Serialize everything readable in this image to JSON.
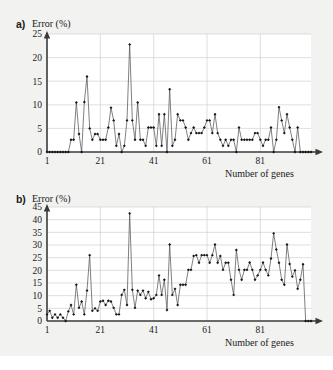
{
  "figure": {
    "background_color": "#f2f2f0",
    "plot_background_color": "#ffffff",
    "gridline_color": "#c9c9c9",
    "axis_color": "#3a3a3a",
    "series_color": "#55555a",
    "marker_color": "#16161a"
  },
  "panel_a": {
    "label": "a)",
    "ylabel": "Error (%)",
    "xlabel": "Number of genes"
  },
  "panel_b": {
    "label": "b)",
    "ylabel": "Error (%)",
    "xlabel": "Number of genes"
  },
  "chart_data": [
    {
      "id": "panel-a",
      "type": "line",
      "title": "a) Error (%)",
      "xlabel": "Number of genes",
      "ylabel": "Error (%)",
      "xlim": [
        1,
        100
      ],
      "ylim": [
        0,
        25
      ],
      "xticks": [
        1,
        21,
        41,
        61,
        81
      ],
      "yticks": [
        0,
        5,
        10,
        15,
        20,
        25
      ],
      "grid": "horizontal-and-vertical",
      "legend": "none",
      "marker": "diamond",
      "x": [
        1,
        2,
        3,
        4,
        5,
        6,
        7,
        8,
        9,
        10,
        11,
        12,
        13,
        14,
        15,
        16,
        17,
        18,
        19,
        20,
        21,
        22,
        23,
        24,
        25,
        26,
        27,
        28,
        29,
        30,
        31,
        32,
        33,
        34,
        35,
        36,
        37,
        38,
        39,
        40,
        41,
        42,
        43,
        44,
        45,
        46,
        47,
        48,
        49,
        50,
        51,
        52,
        53,
        54,
        55,
        56,
        57,
        58,
        59,
        60,
        61,
        62,
        63,
        64,
        65,
        66,
        67,
        68,
        69,
        70,
        71,
        72,
        73,
        74,
        75,
        76,
        77,
        78,
        79,
        80,
        81,
        82,
        83,
        84,
        85,
        86,
        87,
        88,
        89,
        90,
        91,
        92,
        93,
        94,
        95,
        96,
        97,
        98,
        99,
        100
      ],
      "values": [
        0,
        0,
        0,
        0,
        0,
        0,
        0,
        0,
        0,
        2.6,
        2.6,
        10.5,
        3.8,
        0,
        10.6,
        16,
        5,
        2.6,
        3.8,
        3.8,
        2.6,
        2.6,
        2.6,
        5.2,
        9.4,
        6.7,
        1.3,
        3.8,
        0,
        1.3,
        6.7,
        22.8,
        6.7,
        2.6,
        10.5,
        2.6,
        2.6,
        1.3,
        5.2,
        5.2,
        5.2,
        1.3,
        8,
        1.3,
        8,
        0,
        13.3,
        1.3,
        2.6,
        8,
        6.7,
        6.7,
        5.2,
        2.6,
        4,
        5.2,
        4,
        4,
        4,
        5.2,
        6.7,
        6.7,
        4,
        8,
        4,
        2.6,
        1.3,
        2.6,
        1.3,
        2.6,
        2.6,
        0,
        5.2,
        2.6,
        2.6,
        2.6,
        2.6,
        2.6,
        4,
        4,
        2.6,
        1.3,
        2.6,
        2.6,
        5.2,
        0,
        2.6,
        9.5,
        6.7,
        4,
        8,
        5.2,
        2.6,
        0,
        5.2,
        0,
        0,
        0,
        0,
        0
      ]
    },
    {
      "id": "panel-b",
      "type": "line",
      "title": "b) Error (%)",
      "xlabel": "Number of genes",
      "ylabel": "Error (%)",
      "xlim": [
        1,
        100
      ],
      "ylim": [
        0,
        45
      ],
      "xticks": [
        1,
        21,
        41,
        61,
        81
      ],
      "yticks": [
        0,
        5,
        10,
        15,
        20,
        25,
        30,
        35,
        40,
        45
      ],
      "grid": "horizontal-and-vertical",
      "legend": "none",
      "marker": "diamond",
      "x": [
        1,
        2,
        3,
        4,
        5,
        6,
        7,
        8,
        9,
        10,
        11,
        12,
        13,
        14,
        15,
        16,
        17,
        18,
        19,
        20,
        21,
        22,
        23,
        24,
        25,
        26,
        27,
        28,
        29,
        30,
        31,
        32,
        33,
        34,
        35,
        36,
        37,
        38,
        39,
        40,
        41,
        42,
        43,
        44,
        45,
        46,
        47,
        48,
        49,
        50,
        51,
        52,
        53,
        54,
        55,
        56,
        57,
        58,
        59,
        60,
        61,
        62,
        63,
        64,
        65,
        66,
        67,
        68,
        69,
        70,
        71,
        72,
        73,
        74,
        75,
        76,
        77,
        78,
        79,
        80,
        81,
        82,
        83,
        84,
        85,
        86,
        87,
        88,
        89,
        90,
        91,
        92,
        93,
        94,
        95,
        96,
        97,
        98,
        99,
        100
      ],
      "values": [
        2.6,
        4,
        1.3,
        2.6,
        1.3,
        2.6,
        1.3,
        0,
        3.8,
        6.3,
        2.6,
        14.3,
        5.2,
        7.7,
        2.6,
        12,
        26,
        4,
        5,
        4,
        7.7,
        8,
        6.3,
        8,
        7.7,
        5.2,
        2.6,
        2.6,
        10.3,
        12.3,
        6.3,
        42.5,
        12.3,
        5.2,
        12,
        10.3,
        12,
        9,
        11.5,
        8.6,
        9,
        10.3,
        18,
        10.3,
        16.3,
        4.3,
        30.2,
        10.3,
        12.7,
        6.3,
        14.3,
        14.3,
        14.3,
        20.2,
        20.2,
        25.7,
        26,
        23,
        26,
        26,
        26,
        23,
        26,
        30.2,
        23,
        25.7,
        20.2,
        23,
        23,
        16.3,
        10.3,
        28,
        20.2,
        16.3,
        20.2,
        20.2,
        23.1,
        20.2,
        16.3,
        18,
        20.2,
        23.1,
        20.2,
        18,
        24.7,
        34.6,
        28.2,
        23,
        16.3,
        14.3,
        30.2,
        22.5,
        17.5,
        20,
        12.7,
        16.3,
        22.4,
        0,
        0,
        0
      ]
    }
  ]
}
